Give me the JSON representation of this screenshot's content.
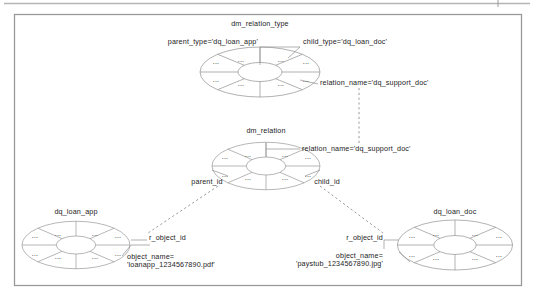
{
  "diagram": {
    "type": "entity-relationship-wheel-diagram",
    "frame": {
      "border_color": "#9a9a9a",
      "background": "#ffffff"
    },
    "entities": [
      {
        "id": "dm_relation_type",
        "title": "dm_relation_type",
        "segments": 8,
        "segment_label": "...",
        "attributes": [
          {
            "name": "parent_type",
            "label": "parent_type='dq_loan_app'"
          },
          {
            "name": "child_type",
            "label": "child_type='dq_loan_doc'"
          },
          {
            "name": "relation_name",
            "label": "relation_name='dq_support_doc'"
          }
        ]
      },
      {
        "id": "dm_relation",
        "title": "dm_relation",
        "segments": 8,
        "segment_label": "...",
        "attributes": [
          {
            "name": "relation_name",
            "label": "relation_name='dq_support_doc'"
          },
          {
            "name": "parent_id",
            "label": "parent_id"
          },
          {
            "name": "child_id",
            "label": "child_id"
          }
        ]
      },
      {
        "id": "dq_loan_app",
        "title": "dq_loan_app",
        "segments": 8,
        "segment_label": "...",
        "attributes": [
          {
            "name": "r_object_id",
            "label": "r_object_id"
          },
          {
            "name": "object_name",
            "label": "object_name=",
            "value": "'loanapp_1234567890.pdf'"
          }
        ]
      },
      {
        "id": "dq_loan_doc",
        "title": "dq_loan_doc",
        "segments": 8,
        "segment_label": "...",
        "attributes": [
          {
            "name": "r_object_id",
            "label": "r_object_id"
          },
          {
            "name": "object_name",
            "label": "object_name=",
            "value": "'paystub_1234567890.jpg'"
          }
        ]
      }
    ],
    "connectors": [
      {
        "from": "dm_relation_type.relation_name",
        "to": "dm_relation.relation_name",
        "style": "dashed"
      },
      {
        "from": "dm_relation.parent_id",
        "to": "dq_loan_app.r_object_id",
        "style": "dashed"
      },
      {
        "from": "dm_relation.child_id",
        "to": "dq_loan_doc.r_object_id",
        "style": "dashed"
      }
    ]
  },
  "labels": {
    "rt_title": "dm_relation_type",
    "rt_parent_type": "parent_type='dq_loan_app'",
    "rt_child_type": "child_type='dq_loan_doc'",
    "rt_relation_name": "relation_name='dq_support_doc'",
    "r_title": "dm_relation",
    "r_relation_name": "relation_name='dq_support_doc'",
    "r_parent_id": "parent_id",
    "r_child_id": "child_id",
    "la_title": "dq_loan_app",
    "la_r_object_id": "r_object_id",
    "la_object_name": "object_name=",
    "la_object_value": "'loanapp_1234567890.pdf'",
    "ld_title": "dq_loan_doc",
    "ld_r_object_id": "r_object_id",
    "ld_object_name": "object_name=",
    "ld_object_value": "'paystub_1234567890.jpg'",
    "seg": "..."
  }
}
